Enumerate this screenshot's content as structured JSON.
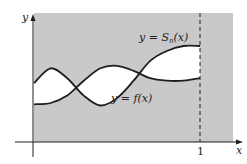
{
  "figure": {
    "type": "function-approximation-diagram",
    "axes": {
      "x_label": "x",
      "y_label": "y",
      "x_tick_label": "1"
    },
    "curves": [
      {
        "name": "S_n",
        "label_prefix": "y = ",
        "label_func": "S",
        "label_sub": "n",
        "label_suffix": "(x)"
      },
      {
        "name": "f",
        "label": "y = f(x)"
      }
    ],
    "colors": {
      "background_shade": "#c9c9c9",
      "region_between": "#ffffff",
      "curve": "#1e1e1e",
      "axis": "#1e1e1e"
    }
  },
  "chart_data": {
    "type": "line",
    "title": "",
    "xlabel": "x",
    "ylabel": "y",
    "xlim": [
      0,
      1.12
    ],
    "x_ticks": [
      "1"
    ],
    "series": [
      {
        "name": "y = S_n(x)",
        "x": [
          0,
          0.1,
          0.2,
          0.3,
          0.4,
          0.5,
          0.6,
          0.7,
          0.8,
          0.9,
          1.0
        ],
        "values": [
          0.7,
          0.82,
          0.74,
          0.6,
          0.52,
          0.58,
          0.72,
          0.88,
          0.96,
          1.0,
          1.0
        ]
      },
      {
        "name": "y = f(x)",
        "x": [
          0,
          0.1,
          0.2,
          0.3,
          0.4,
          0.5,
          0.6,
          0.7,
          0.8,
          0.9,
          1.0
        ],
        "values": [
          0.53,
          0.54,
          0.6,
          0.72,
          0.82,
          0.84,
          0.8,
          0.74,
          0.72,
          0.72,
          0.74
        ]
      }
    ],
    "annotations": [
      "y = S_n(x)",
      "y = f(x)",
      "dashed vertical line at x = 1"
    ],
    "grid": false,
    "legend": "none"
  }
}
